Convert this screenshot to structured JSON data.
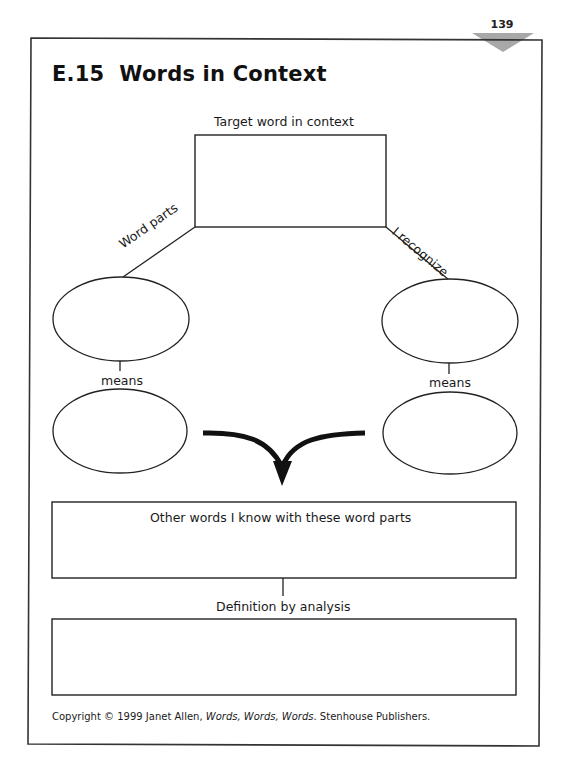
{
  "page": {
    "number": "139",
    "title": "E.15  Words in Context",
    "accent_triangle_color": "#a8a8a8"
  },
  "diagram": {
    "target_label": "Target word in context",
    "left_branch_label": "Word parts",
    "right_branch_label": "I recognize",
    "left_means_label": "means",
    "right_means_label": "means",
    "other_words_label": "Other words I know with these word parts",
    "definition_label": "Definition by analysis"
  },
  "footer": {
    "copyright_prefix": "Copyright © 1999 Janet Allen, ",
    "book_title": "Words, Words, Words",
    "copyright_suffix": ". Stenhouse Publishers."
  }
}
